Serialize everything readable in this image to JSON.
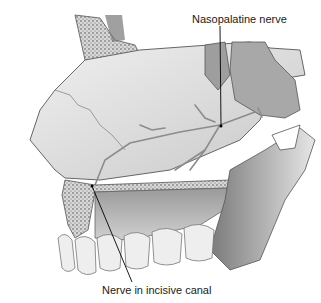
{
  "figure": {
    "colors": {
      "background": "#ffffff",
      "tissue_light": "#dcdcdc",
      "tissue_mid": "#b8b8b8",
      "tissue_dark": "#6e6e6e",
      "bone_speckle": "#4a4a4a",
      "outline": "#555555",
      "nerve": "#8c8c8c",
      "leader_line": "#000000"
    }
  },
  "labels": {
    "top": "Nasopalatine nerve",
    "bottom": "Nerve in incisive canal"
  }
}
